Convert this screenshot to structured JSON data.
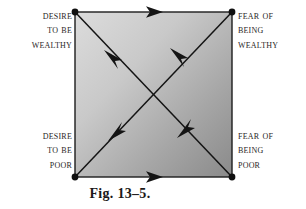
{
  "figure": {
    "caption": "Fig. 13–5.",
    "square": {
      "fill_light": "#d6d6d6",
      "fill_dark": "#8d8d8d",
      "stroke": "#1a1a1a",
      "x": 75,
      "y": 12,
      "width": 157,
      "height": 165
    },
    "labels": {
      "top_left": {
        "name": "desire-to-be-wealthy",
        "lines": [
          "Desire",
          "to be",
          "wealthy"
        ]
      },
      "top_right": {
        "name": "fear-of-being-wealthy",
        "lines": [
          "Fear of",
          "being",
          "wealthy"
        ]
      },
      "bottom_left": {
        "name": "desire-to-be-poor",
        "lines": [
          "Desire",
          "to be",
          "poor"
        ]
      },
      "bottom_right": {
        "name": "fear-of-being-poor",
        "lines": [
          "Fear of",
          "being",
          "poor"
        ]
      }
    },
    "corners": [
      {
        "name": "top-left-node",
        "x": 75,
        "y": 12
      },
      {
        "name": "top-right-node",
        "x": 232,
        "y": 12
      },
      {
        "name": "bottom-left-node",
        "x": 75,
        "y": 177
      },
      {
        "name": "bottom-right-node",
        "x": 232,
        "y": 177
      }
    ],
    "arrows": [
      {
        "name": "top-edge-arrow",
        "direction": "right",
        "from": "top-left",
        "to": "top-right"
      },
      {
        "name": "bottom-edge-arrow",
        "direction": "right",
        "from": "bottom-left",
        "to": "bottom-right"
      },
      {
        "name": "diagonal-upper-left-arrow",
        "direction": "up-left",
        "from": "bottom-right",
        "to": "top-left"
      },
      {
        "name": "diagonal-upper-left-arrow-2",
        "direction": "up-left",
        "from": "bottom-right",
        "to": "top-left"
      },
      {
        "name": "diagonal-down-left-arrow",
        "direction": "down-left",
        "from": "top-right",
        "to": "bottom-left"
      },
      {
        "name": "diagonal-up-left-arrow-3",
        "direction": "up-left",
        "from": "bottom-left",
        "to": "top-right"
      }
    ]
  }
}
